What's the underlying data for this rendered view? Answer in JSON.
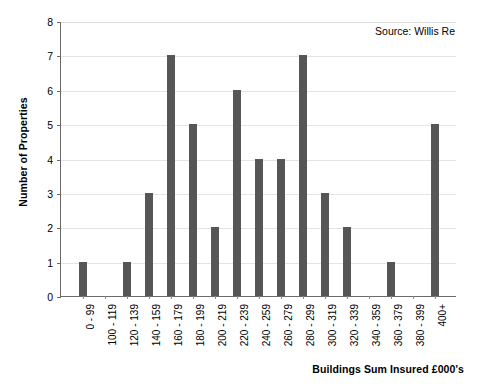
{
  "chart_data": {
    "type": "bar",
    "title": "",
    "xlabel": "Buildings Sum Insured £000's",
    "ylabel": "Number of Properties",
    "categories": [
      "0 - 99",
      "100 - 119",
      "120 - 139",
      "140 - 159",
      "160 - 179",
      "180 - 199",
      "200 - 219",
      "220 - 239",
      "240 - 259",
      "260 - 279",
      "280 - 299",
      "300 - 319",
      "320 - 339",
      "340 - 359",
      "360 - 379",
      "380 - 399",
      "400+"
    ],
    "values": [
      1,
      0,
      1,
      3,
      7,
      5,
      2,
      6,
      4,
      4,
      7,
      3,
      2,
      0,
      1,
      0,
      5
    ],
    "ylim": [
      0,
      8
    ],
    "yticks": [
      0,
      1,
      2,
      3,
      4,
      5,
      6,
      7,
      8
    ],
    "ytick_labels": [
      "0",
      "1",
      "2",
      "3",
      "4",
      "5",
      "6",
      "7",
      "8"
    ],
    "grid": true,
    "grid_axis": "y",
    "legend": false,
    "bar_color": "#565656",
    "grid_color": "#e4e4e4",
    "axis_color": "#6a6a6a",
    "background_color": "#ffffff",
    "annotations": [
      {
        "text": "Source: Willis Re",
        "position": "top-right"
      }
    ]
  },
  "axis_titles": {
    "y": "Number of Properties",
    "x": "Buildings Sum Insured £000's"
  },
  "source": {
    "label": "Source: Willis Re"
  }
}
